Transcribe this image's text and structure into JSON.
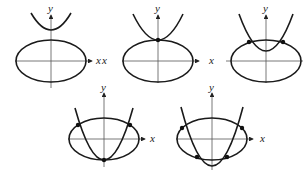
{
  "figure": {
    "axis_labels": {
      "x": "x",
      "y": "y"
    },
    "panels": [
      {
        "id": 1,
        "intersections": 0
      },
      {
        "id": 2,
        "intersections": 1
      },
      {
        "id": 3,
        "intersections": 2
      },
      {
        "id": 4,
        "intersections": 3
      },
      {
        "id": 5,
        "intersections": 4
      }
    ]
  }
}
